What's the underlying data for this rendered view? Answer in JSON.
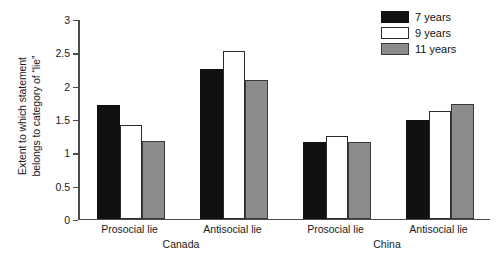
{
  "chart_data": {
    "type": "bar",
    "title": "",
    "xlabel": "",
    "ylabel": "Extent to which statement belongs to category of “lie”",
    "ylabel_lines": [
      "Extent to which statement",
      "belongs to category of “lie”"
    ],
    "ylim": [
      0,
      3
    ],
    "yticks": [
      0,
      0.5,
      1,
      1.5,
      2,
      2.5,
      3
    ],
    "ytick_labels": [
      "0",
      "0.5",
      "1",
      "1.5",
      "2",
      "2.5",
      "3"
    ],
    "grid": false,
    "legend_position": "top-right",
    "categories": [
      "Prosocial lie",
      "Antisocial lie",
      "Prosocial lie",
      "Antisocial lie"
    ],
    "groups": [
      {
        "name": "Canada",
        "categories": [
          "Prosocial lie",
          "Antisocial lie"
        ]
      },
      {
        "name": "China",
        "categories": [
          "Prosocial lie",
          "Antisocial lie"
        ]
      }
    ],
    "series": [
      {
        "name": "7 years",
        "color": "#111111",
        "values": [
          1.7,
          2.25,
          1.15,
          1.48
        ]
      },
      {
        "name": "9 years",
        "color": "#ffffff",
        "values": [
          1.4,
          2.52,
          1.24,
          1.62
        ]
      },
      {
        "name": "11 years",
        "color": "#8c8c8c",
        "values": [
          1.17,
          2.08,
          1.15,
          1.72
        ]
      }
    ]
  },
  "legend": {
    "items": [
      {
        "label": "7 years",
        "swatch": "black"
      },
      {
        "label": "9 years",
        "swatch": "white"
      },
      {
        "label": "11 years",
        "swatch": "gray"
      }
    ]
  }
}
